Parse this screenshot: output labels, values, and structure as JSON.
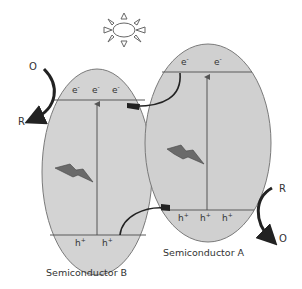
{
  "diagram": {
    "colors": {
      "ellipse_fill": "#d3d3d3",
      "ellipse_stroke": "#7a7a7a",
      "band_line": "#5a5a5a",
      "arrow": "#222222",
      "text": "#333333"
    },
    "sun": {
      "icon": "sun-icon"
    },
    "semiconductor_b": {
      "label": "Semiconductor B",
      "cb_carriers": [
        "e-",
        "e-",
        "e-"
      ],
      "vb_carriers": [
        "h+",
        "h+"
      ],
      "excitation_icon": "lightning-icon"
    },
    "semiconductor_a": {
      "label": "Semiconductor A",
      "cb_carriers": [
        "e-",
        "e-"
      ],
      "vb_carriers": [
        "h+",
        "h+",
        "h+"
      ],
      "excitation_icon": "lightning-icon"
    },
    "left_redox": {
      "oxidized": "O",
      "reduced": "R"
    },
    "right_redox": {
      "reduced": "R",
      "oxidized": "O"
    },
    "electron_symbol": "e",
    "electron_charge": "-",
    "hole_symbol": "h",
    "hole_charge": "+"
  }
}
